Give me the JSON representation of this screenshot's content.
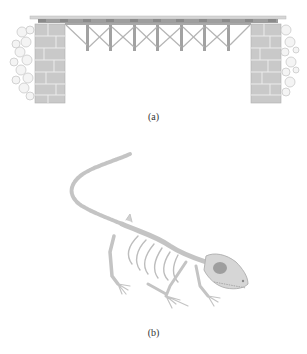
{
  "figure": {
    "panels": [
      {
        "id": "a",
        "label": "(a)",
        "subject": "trestle-bridge-illustration"
      },
      {
        "id": "b",
        "label": "(b)",
        "subject": "lizard-skeleton-illustration"
      }
    ],
    "colors": {
      "stone": "#c8c8c8",
      "stone_dark": "#a8a8a8",
      "timber": "#9a9a9a",
      "deck": "#bdbdbd",
      "bone": "#d4d4d4",
      "bone_outline": "#b0b0b0",
      "eye_socket": "#9c9c9c",
      "caption_text": "#333333"
    }
  }
}
